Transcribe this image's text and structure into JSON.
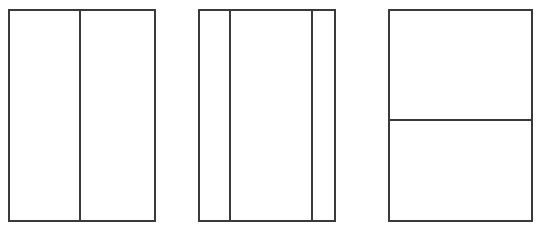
{
  "canvas": {
    "width": 544,
    "height": 232,
    "background_color": "#ffffff",
    "line_color": "#3a3a3a",
    "line_width": 2
  },
  "figures": [
    {
      "id": "figure-1",
      "label": "rectangle-split-into-2-vertical-parts",
      "orientation": "vertical",
      "parts": 2,
      "x": 8,
      "y": 9,
      "width": 148,
      "height": 213,
      "divider_positions": [
        79
      ],
      "cells": [
        {
          "id": "figure-1-cell-1",
          "x": 8,
          "y": 9,
          "width": 71,
          "height": 213
        },
        {
          "id": "figure-1-cell-2",
          "x": 81,
          "y": 9,
          "width": 75,
          "height": 213
        }
      ]
    },
    {
      "id": "figure-2",
      "label": "rectangle-split-into-3-vertical-parts",
      "orientation": "vertical",
      "parts": 3,
      "x": 198,
      "y": 9,
      "width": 138,
      "height": 213,
      "divider_positions": [
        229,
        311
      ],
      "cells": [
        {
          "id": "figure-2-cell-1",
          "x": 198,
          "y": 9,
          "width": 31,
          "height": 213
        },
        {
          "id": "figure-2-cell-2",
          "x": 231,
          "y": 9,
          "width": 80,
          "height": 213
        },
        {
          "id": "figure-2-cell-3",
          "x": 313,
          "y": 9,
          "width": 23,
          "height": 213
        }
      ]
    },
    {
      "id": "figure-3",
      "label": "rectangle-split-into-2-horizontal-parts",
      "orientation": "horizontal",
      "parts": 2,
      "x": 388,
      "y": 9,
      "width": 145,
      "height": 213,
      "divider_positions": [
        119
      ],
      "cells": [
        {
          "id": "figure-3-cell-1",
          "x": 388,
          "y": 9,
          "width": 145,
          "height": 110
        },
        {
          "id": "figure-3-cell-2",
          "x": 388,
          "y": 121,
          "width": 145,
          "height": 101
        }
      ]
    }
  ]
}
